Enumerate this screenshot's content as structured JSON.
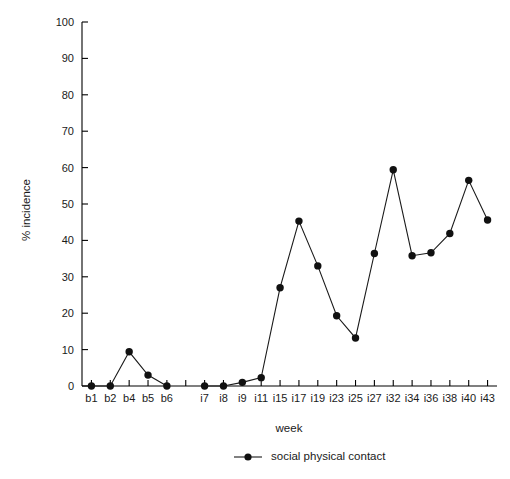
{
  "chart_data": {
    "type": "line",
    "title": "",
    "xlabel": "week",
    "ylabel": "% incidence",
    "ylim": [
      0,
      100
    ],
    "ytick_step": 10,
    "grid": false,
    "legend_position": "bottom-center",
    "marker": "filled-circle",
    "line_color": "#1a1a1a",
    "categories": [
      "b1",
      "b2",
      "b4",
      "b5",
      "b6",
      "",
      "i7",
      "i8",
      "i9",
      "i11",
      "i15",
      "i17",
      "i19",
      "i23",
      "i25",
      "i27",
      "i32",
      "i34",
      "i36",
      "i38",
      "i40",
      "i43"
    ],
    "xtick_labels": [
      "b1",
      "b2",
      "b4",
      "b5",
      "b6",
      "",
      "i7",
      "i8",
      "i9",
      "i11",
      "i15",
      "i17",
      "i19",
      "i23",
      "i25",
      "i27",
      "i32",
      "i34",
      "i36",
      "i38",
      "i40",
      "i43"
    ],
    "ytick_labels": [
      "0",
      "10",
      "20",
      "30",
      "40",
      "50",
      "60",
      "70",
      "80",
      "90",
      "100"
    ],
    "yticks": [
      0,
      10,
      20,
      30,
      40,
      50,
      60,
      70,
      80,
      90,
      100
    ],
    "series": [
      {
        "name": "social physical contact",
        "values": [
          0,
          0,
          9.4,
          3,
          0,
          null,
          0,
          0,
          1,
          2.3,
          27,
          45.3,
          33,
          19.3,
          13.2,
          36.4,
          59.4,
          35.8,
          36.6,
          41.9,
          56.5,
          45.6
        ]
      }
    ],
    "legend": [
      {
        "label": "social physical contact",
        "marker": "filled-circle",
        "color": "#1a1a1a"
      }
    ]
  }
}
